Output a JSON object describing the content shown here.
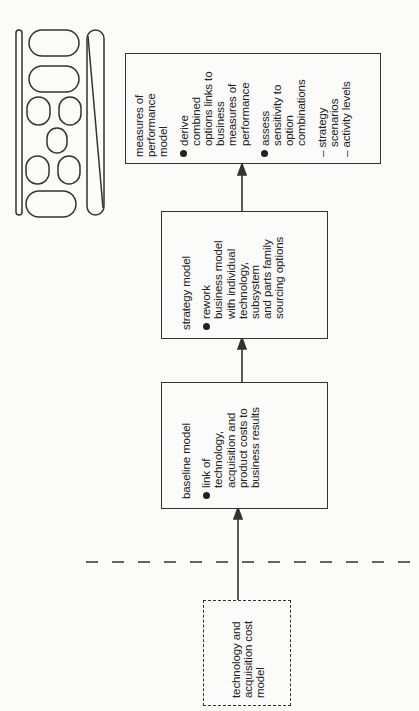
{
  "diagram": {
    "orientation": "rotated 90deg counter-clockwise (flow runs bottom to top)",
    "logo": {
      "icon": "rounded-shapes-logo-icon"
    },
    "boxes": {
      "tech_cost": {
        "style": "dashed",
        "lines": [
          "technology and",
          "acquisition cost",
          "model"
        ]
      },
      "baseline": {
        "title": "baseline model",
        "bullets": [
          {
            "lines": [
              "link of",
              "technology,",
              "acquisition and",
              "product costs to",
              "business results"
            ]
          }
        ]
      },
      "strategy": {
        "title": "strategy model",
        "bullets": [
          {
            "lines": [
              "rework",
              "business model",
              "with individual",
              "technology,",
              "subsystem",
              "and parts family",
              "sourcing options"
            ]
          }
        ]
      },
      "measures": {
        "title_lines": [
          "measures of",
          "performance",
          "model"
        ],
        "bullets": [
          {
            "lines": [
              "derive",
              "combined",
              "options links to",
              "business",
              "measures of",
              "performance"
            ]
          },
          {
            "lines": [
              "assess",
              "sensitivity to",
              "option",
              "combinations"
            ]
          }
        ],
        "sub_items": [
          {
            "lines": [
              "– strategy",
              "scenarios"
            ]
          },
          {
            "lines": [
              "– activity levels"
            ]
          }
        ]
      }
    },
    "connectors": [
      {
        "from": "tech_cost",
        "to": "baseline",
        "type": "arrow"
      },
      {
        "from": "baseline",
        "to": "strategy",
        "type": "arrow"
      },
      {
        "from": "strategy",
        "to": "measures",
        "type": "arrow"
      }
    ],
    "separator": {
      "style": "dashed-line"
    }
  }
}
